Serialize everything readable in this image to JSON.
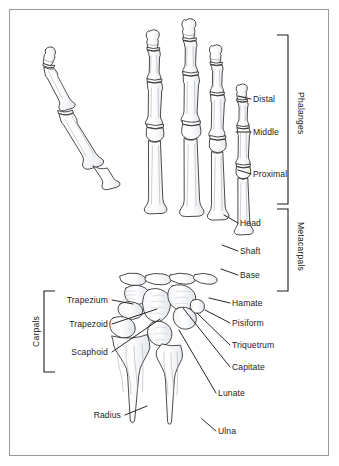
{
  "figure": {
    "border_color": "#9a9a9a",
    "background": "#ffffff",
    "ink_color": "#1c1c1c",
    "bone_outline_color": "#2b2b2b",
    "bone_fill_color": "#fdfdfd",
    "shading_color": "#b9bfc9"
  },
  "brackets": [
    {
      "name": "phalanges",
      "label": "Phalanges",
      "side": "right",
      "x": 288,
      "y_top": 35,
      "y_bottom": 204
    },
    {
      "name": "metacarpals",
      "label": "Metacarpals",
      "side": "right",
      "x": 288,
      "y_top": 209,
      "y_bottom": 291
    },
    {
      "name": "carpals",
      "label": "Carpals",
      "side": "left",
      "x": 44,
      "y_top": 291,
      "y_bottom": 372
    }
  ],
  "labels": {
    "right": [
      {
        "name": "distal",
        "text": "Distal",
        "x": 253,
        "y": 95,
        "leader": [
          [
            251,
            99
          ],
          [
            238,
            96
          ]
        ]
      },
      {
        "name": "middle",
        "text": "Middle",
        "x": 253,
        "y": 128,
        "leader": [
          [
            251,
            132
          ],
          [
            236,
            132
          ]
        ]
      },
      {
        "name": "proximal",
        "text": "Proximal",
        "x": 253,
        "y": 170,
        "leader": [
          [
            251,
            174
          ],
          [
            238,
            170
          ]
        ]
      },
      {
        "name": "head",
        "text": "Head",
        "x": 240,
        "y": 219,
        "leader": [
          [
            238,
            223
          ],
          [
            224,
            215
          ]
        ]
      },
      {
        "name": "shaft",
        "text": "Shaft",
        "x": 240,
        "y": 247,
        "leader": [
          [
            238,
            251
          ],
          [
            222,
            245
          ]
        ]
      },
      {
        "name": "base",
        "text": "Base",
        "x": 240,
        "y": 271,
        "leader": [
          [
            238,
            275
          ],
          [
            221,
            269
          ]
        ]
      },
      {
        "name": "hamate",
        "text": "Hamate",
        "x": 232,
        "y": 299,
        "leader": [
          [
            230,
            303
          ],
          [
            211,
            298
          ]
        ]
      },
      {
        "name": "pisiform",
        "text": "Pisiform",
        "x": 232,
        "y": 319,
        "leader": [
          [
            230,
            323
          ],
          [
            206,
            310
          ]
        ]
      },
      {
        "name": "triquetrum",
        "text": "Triquetrum",
        "x": 232,
        "y": 341,
        "leader": [
          [
            230,
            345
          ],
          [
            198,
            312
          ]
        ]
      },
      {
        "name": "capitate",
        "text": "Capitate",
        "x": 232,
        "y": 363,
        "leader": [
          [
            230,
            367
          ],
          [
            185,
            308
          ]
        ]
      },
      {
        "name": "lunate",
        "text": "Lunate",
        "x": 218,
        "y": 389,
        "leader": [
          [
            216,
            393
          ],
          [
            181,
            327
          ]
        ]
      },
      {
        "name": "ulna",
        "text": "Ulna",
        "x": 218,
        "y": 427,
        "leader": [
          [
            216,
            431
          ],
          [
            203,
            420
          ]
        ]
      }
    ],
    "left": [
      {
        "name": "trapezium",
        "text": "Trapezium",
        "x": 55,
        "y": 296,
        "leader": [
          [
            110,
            300
          ],
          [
            131,
            304
          ]
        ]
      },
      {
        "name": "trapezoid",
        "text": "Trapezoid",
        "x": 63,
        "y": 320,
        "leader": [
          [
            110,
            324
          ],
          [
            157,
            308
          ]
        ]
      },
      {
        "name": "scaphoid",
        "text": "Scaphoid",
        "x": 68,
        "y": 348,
        "leader": [
          [
            110,
            352
          ],
          [
            160,
            318
          ]
        ]
      },
      {
        "name": "radius",
        "text": "Radius",
        "x": 83,
        "y": 411,
        "leader": [
          [
            125,
            415
          ],
          [
            146,
            406
          ]
        ]
      }
    ]
  }
}
